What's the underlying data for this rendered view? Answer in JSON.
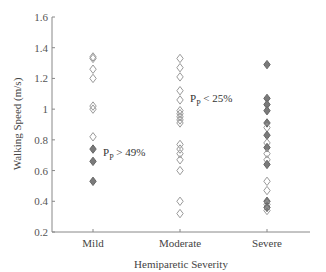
{
  "chart_data": {
    "type": "scatter",
    "title": "",
    "xlabel": "Hemiparetic Severity",
    "ylabel": "Walking Speed (m/s)",
    "ylim": [
      0.2,
      1.6
    ],
    "yticks": [
      0.2,
      0.4,
      0.6,
      0.8,
      1,
      1.2,
      1.4,
      1.6
    ],
    "ytick_labels": [
      "0.2",
      "0.4",
      "0.6",
      "0.8",
      "1",
      "1.2",
      "1.4",
      "1.6"
    ],
    "categories": [
      "Mild",
      "Moderate",
      "Severe"
    ],
    "grid": false,
    "legend": null,
    "marker": "diamond",
    "series": [
      {
        "name": "Mild",
        "points": [
          {
            "y": 1.34,
            "filled": false
          },
          {
            "y": 1.33,
            "filled": false
          },
          {
            "y": 1.26,
            "filled": false
          },
          {
            "y": 1.2,
            "filled": false
          },
          {
            "y": 1.02,
            "filled": false
          },
          {
            "y": 1.0,
            "filled": false
          },
          {
            "y": 0.82,
            "filled": false
          },
          {
            "y": 0.74,
            "filled": true
          },
          {
            "y": 0.66,
            "filled": true
          },
          {
            "y": 0.53,
            "filled": true
          }
        ]
      },
      {
        "name": "Moderate",
        "points": [
          {
            "y": 1.33,
            "filled": false
          },
          {
            "y": 1.27,
            "filled": false
          },
          {
            "y": 1.21,
            "filled": false
          },
          {
            "y": 1.12,
            "filled": false
          },
          {
            "y": 1.06,
            "filled": false
          },
          {
            "y": 0.99,
            "filled": false
          },
          {
            "y": 0.97,
            "filled": false
          },
          {
            "y": 0.95,
            "filled": false
          },
          {
            "y": 0.93,
            "filled": false
          },
          {
            "y": 0.91,
            "filled": false
          },
          {
            "y": 0.77,
            "filled": false
          },
          {
            "y": 0.74,
            "filled": false
          },
          {
            "y": 0.71,
            "filled": false
          },
          {
            "y": 0.67,
            "filled": false
          },
          {
            "y": 0.6,
            "filled": false
          },
          {
            "y": 0.4,
            "filled": false
          },
          {
            "y": 0.32,
            "filled": false
          }
        ]
      },
      {
        "name": "Severe",
        "points": [
          {
            "y": 1.29,
            "filled": true
          },
          {
            "y": 1.07,
            "filled": true
          },
          {
            "y": 1.03,
            "filled": true
          },
          {
            "y": 0.99,
            "filled": true
          },
          {
            "y": 0.91,
            "filled": true
          },
          {
            "y": 0.88,
            "filled": false
          },
          {
            "y": 0.83,
            "filled": true
          },
          {
            "y": 0.78,
            "filled": false
          },
          {
            "y": 0.75,
            "filled": true
          },
          {
            "y": 0.71,
            "filled": false
          },
          {
            "y": 0.67,
            "filled": false
          },
          {
            "y": 0.64,
            "filled": true
          },
          {
            "y": 0.53,
            "filled": false
          },
          {
            "y": 0.47,
            "filled": false
          },
          {
            "y": 0.4,
            "filled": true
          },
          {
            "y": 0.38,
            "filled": false
          },
          {
            "y": 0.36,
            "filled": true
          },
          {
            "y": 0.34,
            "filled": false
          }
        ]
      }
    ],
    "annotations": [
      {
        "text_main": "P",
        "text_sub": "P",
        "text_rest": " > 49%",
        "x_category": "Mild",
        "y": 0.72
      },
      {
        "text_main": "P",
        "text_sub": "P",
        "text_rest": " < 25%",
        "x_category": "Moderate",
        "y": 1.07
      }
    ],
    "colors": {
      "axis": "#888888",
      "marker_open_stroke": "#9a9a9a",
      "marker_filled": "#7a7a7a",
      "marker_filled_stroke": "#666666",
      "text": "#444444"
    }
  }
}
